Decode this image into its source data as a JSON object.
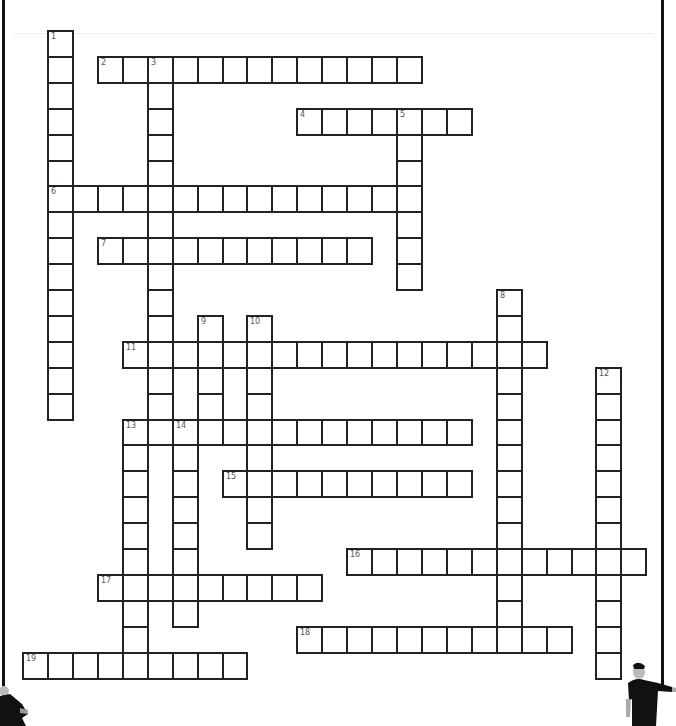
{
  "puzzle": {
    "type": "crossword",
    "grid": {
      "origin_x": 48,
      "origin_y": 31,
      "cell_width": 24.93,
      "cell_height": 25.9
    },
    "colors": {
      "cell_border": "#222222",
      "cell_fill": "#ffffff",
      "number_text": "#555555",
      "pole": "#111111",
      "background": "#ffffff"
    },
    "entries": [
      {
        "number": "1",
        "direction": "down",
        "col": 0,
        "row": 0,
        "length": 15
      },
      {
        "number": "2",
        "direction": "across",
        "col": 2,
        "row": 1,
        "length": 13
      },
      {
        "number": "3",
        "direction": "down",
        "col": 4,
        "row": 1,
        "length": 15
      },
      {
        "number": "4",
        "direction": "across",
        "col": 10,
        "row": 3,
        "length": 7
      },
      {
        "number": "5",
        "direction": "down",
        "col": 14,
        "row": 3,
        "length": 7
      },
      {
        "number": "6",
        "direction": "across",
        "col": 0,
        "row": 6,
        "length": 15
      },
      {
        "number": "7",
        "direction": "across",
        "col": 2,
        "row": 8,
        "length": 11
      },
      {
        "number": "8",
        "direction": "down",
        "col": 18,
        "row": 10,
        "length": 14
      },
      {
        "number": "9",
        "direction": "down",
        "col": 6,
        "row": 11,
        "length": 5
      },
      {
        "number": "10",
        "direction": "down",
        "col": 8,
        "row": 11,
        "length": 9
      },
      {
        "number": "11",
        "direction": "across",
        "col": 3,
        "row": 12,
        "length": 17
      },
      {
        "number": "12",
        "direction": "down",
        "col": 22,
        "row": 13,
        "length": 12
      },
      {
        "number": "13",
        "direction": "across",
        "col": 3,
        "row": 15,
        "length": 14
      },
      {
        "number": "13",
        "direction": "down",
        "col": 3,
        "row": 15,
        "length": 10
      },
      {
        "number": "14",
        "direction": "down",
        "col": 5,
        "row": 15,
        "length": 8
      },
      {
        "number": "15",
        "direction": "across",
        "col": 7,
        "row": 17,
        "length": 10
      },
      {
        "number": "16",
        "direction": "across",
        "col": 12,
        "row": 20,
        "length": 12
      },
      {
        "number": "17",
        "direction": "across",
        "col": 2,
        "row": 21,
        "length": 9
      },
      {
        "number": "18",
        "direction": "across",
        "col": 10,
        "row": 23,
        "length": 11
      },
      {
        "number": "19",
        "direction": "across",
        "col": -1,
        "row": 24,
        "length": 9
      }
    ]
  },
  "decorations": {
    "left_figure": "person-holding-pole-icon",
    "right_figure": "person-holding-pole-icon"
  }
}
